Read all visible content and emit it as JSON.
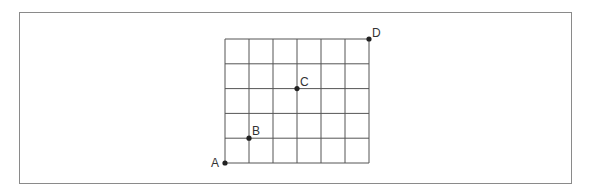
{
  "diagram": {
    "type": "grid-with-points",
    "columns": 6,
    "rows": 5,
    "grid_origin_px": [
      225,
      163
    ],
    "cell_width_px": 24,
    "cell_height_px": 24.8,
    "line_color": "#555555",
    "point_color": "#222222",
    "points": [
      {
        "label": "A",
        "grid": [
          0,
          0
        ],
        "label_offset": [
          -14,
          4
        ]
      },
      {
        "label": "B",
        "grid": [
          1,
          1
        ],
        "label_offset": [
          3,
          -3
        ]
      },
      {
        "label": "C",
        "grid": [
          3,
          3
        ],
        "label_offset": [
          3,
          -3
        ]
      },
      {
        "label": "D",
        "grid": [
          6,
          5
        ],
        "label_offset": [
          3,
          -2
        ]
      }
    ]
  }
}
